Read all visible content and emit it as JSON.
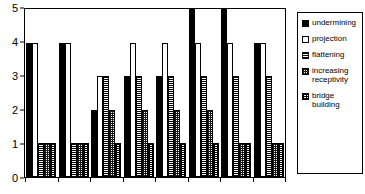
{
  "chart_data": {
    "type": "bar",
    "title": "",
    "xlabel": "",
    "ylabel": "",
    "ylim": [
      0,
      5
    ],
    "yticks": [
      0,
      1,
      2,
      3,
      4,
      5
    ],
    "ytick_labels": [
      "0",
      "1",
      "2",
      "3",
      "4",
      "5"
    ],
    "grid": false,
    "legend_position": "right",
    "categories": [
      "1",
      "2",
      "3",
      "4",
      "5",
      "6",
      "7",
      "8"
    ],
    "series": [
      {
        "name": "undermining",
        "fill": "solid",
        "values": [
          4,
          4,
          2,
          3,
          3,
          5,
          5,
          4
        ]
      },
      {
        "name": "projection",
        "fill": "empty",
        "values": [
          4,
          4,
          3,
          4,
          4,
          4,
          4,
          4
        ]
      },
      {
        "name": "flattening",
        "fill": "hlines",
        "values": [
          1,
          1,
          3,
          3,
          3,
          3,
          3,
          3
        ]
      },
      {
        "name": "increasing receptivity",
        "fill": "checker",
        "values": [
          1,
          1,
          2,
          2,
          2,
          2,
          1,
          1
        ]
      },
      {
        "name": "bridge building",
        "fill": "dots",
        "values": [
          1,
          1,
          1,
          1,
          1,
          1,
          1,
          1
        ]
      }
    ]
  },
  "legend": {
    "items": [
      {
        "label": "undermining",
        "fill": "solid"
      },
      {
        "label": "projection",
        "fill": "empty"
      },
      {
        "label": "flattening",
        "fill": "hlines"
      },
      {
        "label": "increasing receptivity",
        "fill": "checker"
      },
      {
        "label": "bridge building",
        "fill": "dots"
      }
    ]
  }
}
